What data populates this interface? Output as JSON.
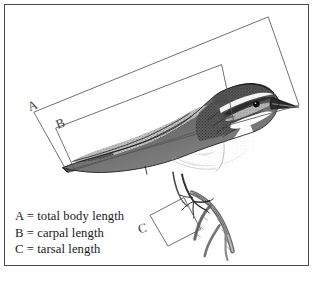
{
  "figure": {
    "type": "labelled-illustration",
    "style": "black-and-white stipple / pen-and-ink engraving",
    "background_color": "#ffffff",
    "frame_color": "#4a4a4a",
    "ink_color": "#1a1a1a",
    "measurement_line_color": "#555555"
  },
  "measurement_boxes": [
    {
      "id": "A",
      "label": "A",
      "meaning": "total body length",
      "description": "large outer rotated rectangle spanning from tail tip to beak tip"
    },
    {
      "id": "B",
      "label": "B",
      "meaning": "carpal length",
      "description": "inner rotated rectangle spanning from wing tip to carpal joint at the shoulder"
    },
    {
      "id": "C",
      "label": "C",
      "meaning": "tarsal length",
      "description": "small rotated square spanning the tarsus of the leg"
    }
  ],
  "legend": {
    "lines": [
      "A = total body length",
      "B = carpal length",
      "C = tarsal length"
    ]
  },
  "caption": {
    "text": ""
  }
}
